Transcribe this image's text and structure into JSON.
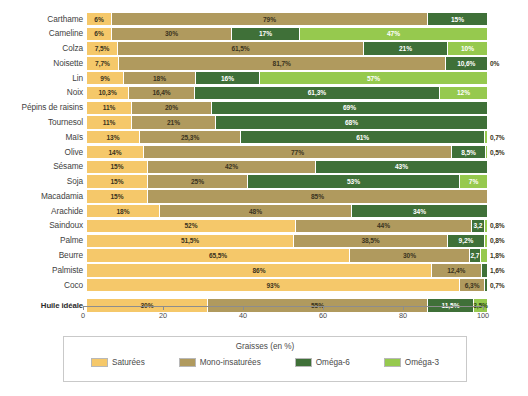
{
  "chart_data": {
    "type": "bar",
    "orientation": "horizontal",
    "stacked": true,
    "title": "",
    "xlabel": "Graisses (en %)",
    "ylabel": "",
    "xlim": [
      0,
      100
    ],
    "xticks": [
      0,
      20,
      40,
      60,
      80,
      100
    ],
    "xtick_labels": [
      "0",
      "20",
      "40",
      "60",
      "80",
      "100"
    ],
    "grid": false,
    "legend_position": "bottom",
    "unit_suffix": "%",
    "series": [
      {
        "name": "Saturées",
        "color": "#f5c86a"
      },
      {
        "name": "Mono-insaturées",
        "color": "#b09a5e"
      },
      {
        "name": "Oméga-6",
        "color": "#3f7038"
      },
      {
        "name": "Oméga-3",
        "color": "#96c94e"
      }
    ],
    "categories": [
      "Carthame",
      "Cameline",
      "Colza",
      "Noisette",
      "Lin",
      "Noix",
      "Pépins de raisins",
      "Tournesol",
      "Maïs",
      "Olive",
      "Sésame",
      "Soja",
      "Macadamia",
      "Arachide",
      "Saindoux",
      "Palme",
      "Beurre",
      "Palmiste",
      "Coco"
    ],
    "rows": [
      {
        "category": "Carthame",
        "values": [
          6,
          79,
          15,
          0
        ],
        "labels": [
          "6%",
          "79%",
          "15%",
          ""
        ],
        "outside": ""
      },
      {
        "category": "Cameline",
        "values": [
          6,
          30,
          17,
          47
        ],
        "labels": [
          "6%",
          "30%",
          "17%",
          "47%"
        ],
        "outside": ""
      },
      {
        "category": "Colza",
        "values": [
          7.5,
          61.5,
          21,
          10
        ],
        "labels": [
          "7,5%",
          "61,5%",
          "21%",
          "10%"
        ],
        "outside": ""
      },
      {
        "category": "Noisette",
        "values": [
          7.7,
          81.7,
          10.6,
          0
        ],
        "labels": [
          "7,7%",
          "81,7%",
          "10,6%",
          ""
        ],
        "outside": "0%"
      },
      {
        "category": "Lin",
        "values": [
          9,
          18,
          16,
          57
        ],
        "labels": [
          "9%",
          "18%",
          "16%",
          "57%"
        ],
        "outside": ""
      },
      {
        "category": "Noix",
        "values": [
          10.3,
          16.4,
          61.3,
          12
        ],
        "labels": [
          "10,3%",
          "16,4%",
          "61,3%",
          "12%"
        ],
        "outside": ""
      },
      {
        "category": "Pépins de raisins",
        "values": [
          11,
          20,
          69,
          0
        ],
        "labels": [
          "11%",
          "20%",
          "69%",
          ""
        ],
        "outside": ""
      },
      {
        "category": "Tournesol",
        "values": [
          11,
          21,
          68,
          0
        ],
        "labels": [
          "11%",
          "21%",
          "68%",
          ""
        ],
        "outside": ""
      },
      {
        "category": "Maïs",
        "values": [
          13,
          25.3,
          61,
          0.7
        ],
        "labels": [
          "13%",
          "25,3%",
          "61%",
          ""
        ],
        "outside": "0,7%"
      },
      {
        "category": "Olive",
        "values": [
          14,
          77,
          8.5,
          0.5
        ],
        "labels": [
          "14%",
          "77%",
          "8,5%",
          ""
        ],
        "outside": "0,5%"
      },
      {
        "category": "Sésame",
        "values": [
          15,
          42,
          43,
          0
        ],
        "labels": [
          "15%",
          "42%",
          "43%",
          ""
        ],
        "outside": ""
      },
      {
        "category": "Soja",
        "values": [
          15,
          25,
          53,
          7
        ],
        "labels": [
          "15%",
          "25%",
          "53%",
          "7%"
        ],
        "outside": ""
      },
      {
        "category": "Macadamia",
        "values": [
          15,
          85,
          0,
          0
        ],
        "labels": [
          "15%",
          "85%",
          "",
          ""
        ],
        "outside": ""
      },
      {
        "category": "Arachide",
        "values": [
          18,
          48,
          34,
          0
        ],
        "labels": [
          "18%",
          "48%",
          "34%",
          ""
        ],
        "outside": ""
      },
      {
        "category": "Saindoux",
        "values": [
          52,
          44,
          3.2,
          0.8
        ],
        "labels": [
          "52%",
          "44%",
          "3,2",
          ""
        ],
        "outside": "0,8%"
      },
      {
        "category": "Palme",
        "values": [
          51.5,
          38.5,
          9.2,
          0.8
        ],
        "labels": [
          "51,5%",
          "38,5%",
          "9,2%",
          ""
        ],
        "outside": "0,8%"
      },
      {
        "category": "Beurre",
        "values": [
          65.5,
          30,
          2.7,
          1.8
        ],
        "labels": [
          "65,5%",
          "30%",
          "2,7",
          ""
        ],
        "outside": "1,8%"
      },
      {
        "category": "Palmiste",
        "values": [
          86,
          12.4,
          1.6,
          0
        ],
        "labels": [
          "86%",
          "12,4%",
          "",
          ""
        ],
        "outside": "1,6%"
      },
      {
        "category": "Coco",
        "values": [
          93,
          6.3,
          0.7,
          0
        ],
        "labels": [
          "93%",
          "6,3%",
          "",
          ""
        ],
        "outside": "0,7%"
      }
    ],
    "reference_row": {
      "category": "Huile idéale",
      "values": [
        30,
        55,
        11.5,
        3.5
      ],
      "labels": [
        "30%",
        "55%",
        "11,5%",
        "3,5%"
      ],
      "outside": ""
    }
  },
  "legend": {
    "title": "Graisses (en %)",
    "items": [
      {
        "label": "Saturées",
        "color": "#f5c86a",
        "icon": "color-swatch-icon"
      },
      {
        "label": "Mono-insaturées",
        "color": "#b09a5e",
        "icon": "color-swatch-icon"
      },
      {
        "label": "Oméga-6",
        "color": "#3f7038",
        "icon": "color-swatch-icon"
      },
      {
        "label": "Oméga-3",
        "color": "#96c94e",
        "icon": "color-swatch-icon"
      }
    ]
  }
}
